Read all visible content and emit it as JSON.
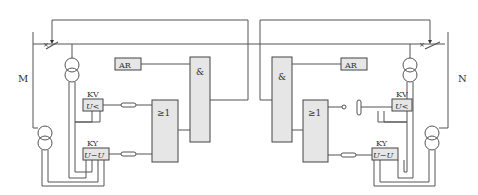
{
  "diagram": {
    "type": "relay-protection-schematic",
    "left_station": {
      "bus_label": "M",
      "ar_label": "AR",
      "and_gate_label": "&",
      "or_gate_label": "≥1",
      "kv_label": "KV",
      "kv_function": "U<",
      "ky_label": "KY",
      "ky_function": "U−U"
    },
    "right_station": {
      "bus_label": "N",
      "ar_label": "AR",
      "and_gate_label": "&",
      "or_gate_label": "≥1",
      "kv_label": "KV",
      "kv_function": "U<",
      "ky_label": "KY",
      "ky_function": "U−U"
    },
    "colors": {
      "line": "#555555",
      "block_fill": "#e6e6e6",
      "block_stroke": "#444444",
      "text": "#333333"
    }
  }
}
